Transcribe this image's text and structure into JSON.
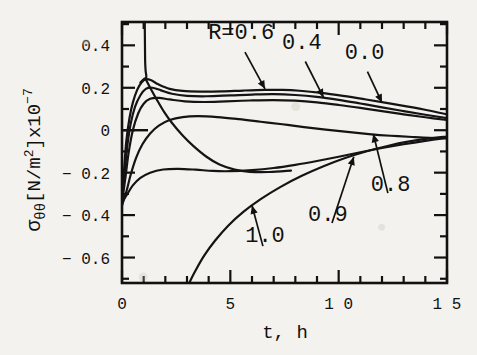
{
  "chart_data": {
    "type": "line",
    "title": "",
    "xlabel": "t,  h",
    "ylabel_parts": {
      "sigma": "σ",
      "sub": "θθ",
      "bracket_open": "[N/m",
      "sup_m": "2",
      "bracket_close": "]x10",
      "sup_exp": "−7"
    },
    "ylabel": "σθθ [N/m2]x10−7",
    "xlim": [
      0,
      15
    ],
    "ylim": [
      -0.72,
      0.51
    ],
    "xticks": [
      0,
      5,
      10,
      15
    ],
    "xticklabels": [
      "0",
      "5",
      "1 0",
      "1 5"
    ],
    "yticks": [
      0.4,
      0.2,
      0,
      -0.2,
      -0.4,
      -0.6
    ],
    "yticklabels": [
      "0.4",
      "0.2",
      "0",
      "− 0.2",
      "− 0.4",
      "− 0.6"
    ],
    "x_minor_step": 1,
    "y_minor_step": 0.1,
    "grid": false,
    "legend_position": "inline-annotations",
    "legend_prefix": "R=",
    "series": [
      {
        "name": "0.0",
        "label": "0.0",
        "points": [
          [
            0.0,
            -0.3
          ],
          [
            0.1,
            -0.18
          ],
          [
            0.2,
            -0.05
          ],
          [
            0.35,
            0.06
          ],
          [
            0.5,
            0.13
          ],
          [
            0.7,
            0.19
          ],
          [
            0.9,
            0.225
          ],
          [
            1.1,
            0.24
          ],
          [
            1.35,
            0.235
          ],
          [
            1.7,
            0.215
          ],
          [
            2.2,
            0.195
          ],
          [
            2.8,
            0.185
          ],
          [
            3.6,
            0.182
          ],
          [
            4.6,
            0.183
          ],
          [
            5.6,
            0.187
          ],
          [
            6.6,
            0.19
          ],
          [
            7.4,
            0.19
          ],
          [
            8.2,
            0.186
          ],
          [
            9.2,
            0.176
          ],
          [
            10.2,
            0.162
          ],
          [
            11.2,
            0.146
          ],
          [
            12.2,
            0.129
          ],
          [
            13.2,
            0.111
          ],
          [
            14.1,
            0.094
          ],
          [
            15.0,
            0.075
          ]
        ]
      },
      {
        "name": "0.4",
        "label": "0.4",
        "points": [
          [
            0.0,
            -0.32
          ],
          [
            0.12,
            -0.2
          ],
          [
            0.25,
            -0.07
          ],
          [
            0.4,
            0.03
          ],
          [
            0.6,
            0.11
          ],
          [
            0.85,
            0.165
          ],
          [
            1.1,
            0.195
          ],
          [
            1.4,
            0.2
          ],
          [
            1.8,
            0.188
          ],
          [
            2.3,
            0.172
          ],
          [
            3.0,
            0.162
          ],
          [
            3.9,
            0.16
          ],
          [
            5.0,
            0.164
          ],
          [
            6.0,
            0.168
          ],
          [
            7.0,
            0.17
          ],
          [
            8.0,
            0.166
          ],
          [
            9.0,
            0.157
          ],
          [
            10.0,
            0.143
          ],
          [
            11.0,
            0.126
          ],
          [
            12.0,
            0.108
          ],
          [
            13.0,
            0.09
          ],
          [
            14.0,
            0.073
          ],
          [
            15.0,
            0.057
          ]
        ]
      },
      {
        "name": "0.6",
        "label": "0.6",
        "points": [
          [
            0.0,
            -0.34
          ],
          [
            0.15,
            -0.23
          ],
          [
            0.3,
            -0.11
          ],
          [
            0.5,
            0.0
          ],
          [
            0.75,
            0.08
          ],
          [
            1.0,
            0.125
          ],
          [
            1.3,
            0.148
          ],
          [
            1.7,
            0.152
          ],
          [
            2.2,
            0.145
          ],
          [
            2.9,
            0.136
          ],
          [
            3.8,
            0.133
          ],
          [
            4.8,
            0.136
          ],
          [
            5.9,
            0.14
          ],
          [
            7.0,
            0.142
          ],
          [
            8.0,
            0.139
          ],
          [
            9.0,
            0.131
          ],
          [
            10.0,
            0.119
          ],
          [
            11.0,
            0.105
          ],
          [
            12.0,
            0.09
          ],
          [
            13.0,
            0.075
          ],
          [
            14.0,
            0.061
          ],
          [
            15.0,
            0.048
          ]
        ]
      },
      {
        "name": "0.8",
        "label": "0.8",
        "points": [
          [
            0.0,
            -0.355
          ],
          [
            0.2,
            -0.29
          ],
          [
            0.4,
            -0.21
          ],
          [
            0.65,
            -0.13
          ],
          [
            0.95,
            -0.065
          ],
          [
            1.3,
            -0.015
          ],
          [
            1.7,
            0.022
          ],
          [
            2.2,
            0.048
          ],
          [
            2.8,
            0.062
          ],
          [
            3.5,
            0.066
          ],
          [
            4.4,
            0.062
          ],
          [
            5.4,
            0.052
          ],
          [
            6.4,
            0.04
          ],
          [
            7.4,
            0.028
          ],
          [
            8.4,
            0.015
          ],
          [
            9.4,
            0.003
          ],
          [
            10.4,
            -0.008
          ],
          [
            11.4,
            -0.018
          ],
          [
            12.4,
            -0.026
          ],
          [
            13.4,
            -0.032
          ],
          [
            14.2,
            -0.036
          ],
          [
            15.0,
            -0.038
          ]
        ]
      },
      {
        "name": "0.9",
        "label": "0.9",
        "points": [
          [
            0.0,
            -0.34
          ],
          [
            0.25,
            -0.3
          ],
          [
            0.5,
            -0.26
          ],
          [
            0.85,
            -0.225
          ],
          [
            1.3,
            -0.2
          ],
          [
            1.9,
            -0.185
          ],
          [
            2.6,
            -0.182
          ],
          [
            3.4,
            -0.186
          ],
          [
            4.2,
            -0.192
          ],
          [
            5.0,
            -0.193
          ],
          [
            6.0,
            -0.188
          ],
          [
            7.0,
            -0.178
          ],
          [
            8.0,
            -0.163
          ],
          [
            9.0,
            -0.145
          ],
          [
            10.0,
            -0.125
          ],
          [
            11.0,
            -0.104
          ],
          [
            12.0,
            -0.084
          ],
          [
            13.0,
            -0.066
          ],
          [
            14.0,
            -0.05
          ],
          [
            15.0,
            -0.036
          ]
        ]
      },
      {
        "name": "1.0",
        "label": "1.0",
        "points": [
          [
            3.1,
            -0.72
          ],
          [
            3.4,
            -0.66
          ],
          [
            3.8,
            -0.59
          ],
          [
            4.3,
            -0.52
          ],
          [
            4.9,
            -0.45
          ],
          [
            5.6,
            -0.385
          ],
          [
            6.4,
            -0.325
          ],
          [
            7.3,
            -0.268
          ],
          [
            8.3,
            -0.215
          ],
          [
            9.3,
            -0.17
          ],
          [
            10.3,
            -0.131
          ],
          [
            11.3,
            -0.099
          ],
          [
            12.3,
            -0.073
          ],
          [
            13.2,
            -0.054
          ],
          [
            14.1,
            -0.04
          ],
          [
            15.0,
            -0.03
          ]
        ]
      },
      {
        "name": "vertical-asymptote",
        "label": "",
        "points": [
          [
            1.05,
            0.51
          ],
          [
            1.06,
            0.4
          ],
          [
            1.07,
            0.32
          ],
          [
            1.09,
            0.28
          ],
          [
            1.12,
            0.25
          ],
          [
            1.0,
            0.24
          ],
          [
            0.85,
            0.225
          ]
        ]
      },
      {
        "name": "steep-descending",
        "label": "",
        "points": [
          [
            1.1,
            0.24
          ],
          [
            1.3,
            0.2
          ],
          [
            1.6,
            0.145
          ],
          [
            1.95,
            0.085
          ],
          [
            2.3,
            0.035
          ],
          [
            2.8,
            -0.025
          ],
          [
            3.3,
            -0.075
          ],
          [
            3.9,
            -0.125
          ],
          [
            4.5,
            -0.162
          ],
          [
            5.2,
            -0.186
          ],
          [
            5.9,
            -0.196
          ],
          [
            6.8,
            -0.197
          ],
          [
            7.8,
            -0.19
          ]
        ]
      }
    ],
    "annotations": [
      {
        "text": "R=0.6",
        "label_x": 5.5,
        "label_y": 0.43,
        "arrow_to_x": 6.6,
        "arrow_to_y": 0.195
      },
      {
        "text": "0.4",
        "label_x": 8.3,
        "label_y": 0.385,
        "arrow_to_x": 9.3,
        "arrow_to_y": 0.155
      },
      {
        "text": "0.0",
        "label_x": 11.2,
        "label_y": 0.335,
        "arrow_to_x": 12.0,
        "arrow_to_y": 0.13
      },
      {
        "text": "0.8",
        "label_x": 12.4,
        "label_y": -0.285,
        "arrow_to_x": 11.6,
        "arrow_to_y": -0.018
      },
      {
        "text": "0.9",
        "label_x": 9.5,
        "label_y": -0.43,
        "arrow_to_x": 10.7,
        "arrow_to_y": -0.125
      },
      {
        "text": "1.0",
        "label_x": 6.6,
        "label_y": -0.525,
        "arrow_to_x": 6.0,
        "arrow_to_y": -0.355
      }
    ]
  },
  "figure": {
    "line_color": "#141414",
    "axis_color": "#111111",
    "background_color": "#f4f2ee",
    "text_color": "#111111"
  }
}
